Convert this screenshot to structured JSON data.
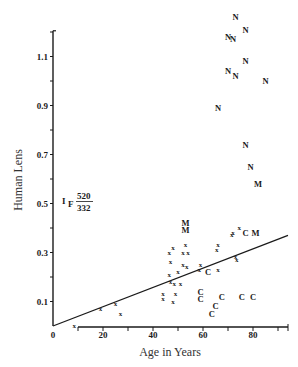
{
  "chart_data": {
    "type": "scatter",
    "title": "",
    "xlabel": "Age in Years",
    "ylabel": "Human Lens",
    "xlim": [
      0,
      95
    ],
    "ylim": [
      0,
      1.2
    ],
    "x_ticks": [
      0,
      10,
      20,
      30,
      40,
      50,
      60,
      70,
      80,
      90
    ],
    "x_tick_labels": [
      "0",
      "20",
      "40",
      "60",
      "80"
    ],
    "x_tick_label_values": [
      0,
      20,
      40,
      60,
      80
    ],
    "y_ticks": [
      0.1,
      0.2,
      0.3,
      0.4,
      0.5,
      0.6,
      0.7,
      0.8,
      0.9,
      1.0,
      1.1,
      1.2
    ],
    "y_tick_labels": [
      "0.1",
      "0.3",
      "0.5",
      "0.7",
      "0.9",
      "1.1"
    ],
    "y_tick_label_values": [
      0.1,
      0.3,
      0.5,
      0.7,
      0.9,
      1.1
    ],
    "grid": false,
    "legend": null,
    "annotation": {
      "symbol": "I",
      "subscript": "F",
      "numerator": "520",
      "denominator": "332",
      "x": 6,
      "y": 0.48
    },
    "regression_line": {
      "x0": 0,
      "y0": 0.0,
      "x1": 94,
      "y1": 0.37
    },
    "series": [
      {
        "name": "x",
        "marker": "x",
        "points": [
          [
            8.5,
            0.0
          ],
          [
            19,
            0.07
          ],
          [
            25,
            0.09
          ],
          [
            27,
            0.05
          ],
          [
            44,
            0.13
          ],
          [
            44,
            0.11
          ],
          [
            46.5,
            0.3
          ],
          [
            46.5,
            0.21
          ],
          [
            47,
            0.26
          ],
          [
            47,
            0.18
          ],
          [
            48,
            0.32
          ],
          [
            48,
            0.1
          ],
          [
            48.5,
            0.17
          ],
          [
            49,
            0.13
          ],
          [
            50,
            0.22
          ],
          [
            51,
            0.17
          ],
          [
            52,
            0.3
          ],
          [
            52,
            0.25
          ],
          [
            53,
            0.33
          ],
          [
            53.5,
            0.24
          ],
          [
            54,
            0.3
          ],
          [
            58.5,
            0.23
          ],
          [
            59,
            0.25
          ],
          [
            65.5,
            0.31
          ],
          [
            66,
            0.33
          ],
          [
            66,
            0.23
          ],
          [
            71.5,
            0.37
          ],
          [
            72,
            0.38
          ],
          [
            73,
            0.28
          ],
          [
            73.5,
            0.27
          ],
          [
            74.5,
            0.4
          ]
        ]
      },
      {
        "name": "C",
        "marker": "C",
        "points": [
          [
            59,
            0.14
          ],
          [
            59,
            0.11
          ],
          [
            62,
            0.22
          ],
          [
            63.5,
            0.05
          ],
          [
            65,
            0.08
          ],
          [
            67.5,
            0.12
          ],
          [
            75.5,
            0.12
          ],
          [
            77,
            0.38
          ],
          [
            80,
            0.12
          ]
        ]
      },
      {
        "name": "M",
        "marker": "M",
        "points": [
          [
            53,
            0.42
          ],
          [
            53,
            0.39
          ],
          [
            81,
            0.38
          ],
          [
            82,
            0.58
          ]
        ]
      },
      {
        "name": "N",
        "marker": "N",
        "points": [
          [
            66,
            0.89
          ],
          [
            70,
            1.18
          ],
          [
            70,
            1.04
          ],
          [
            72,
            1.17
          ],
          [
            73,
            1.26
          ],
          [
            73,
            1.02
          ],
          [
            77,
            1.21
          ],
          [
            77,
            1.08
          ],
          [
            77,
            0.74
          ],
          [
            79,
            0.65
          ],
          [
            85,
            1.0
          ]
        ]
      }
    ]
  }
}
